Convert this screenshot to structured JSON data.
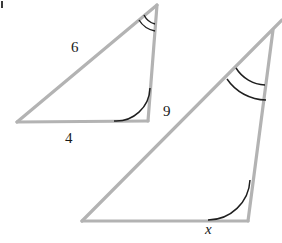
{
  "figure": {
    "stroke_color": "#b3b3b3",
    "arc_color": "#1f1f1f",
    "background": "#ffffff",
    "line_width": 3.2,
    "arc_width": 1.4
  },
  "small_triangle": {
    "name": "small-triangle",
    "vertices": {
      "left": {
        "x": 17,
        "y": 122
      },
      "apex": {
        "x": 157,
        "y": 5
      },
      "right": {
        "x": 148,
        "y": 121
      }
    },
    "labels": {
      "hypotenuse": "6",
      "base": "4"
    },
    "angle_marks": {
      "apex": "double-arc",
      "right": "single-arc",
      "left": "none"
    }
  },
  "large_triangle": {
    "name": "large-triangle",
    "vertices": {
      "left": {
        "x": 82,
        "y": 221
      },
      "apex": {
        "x": 281,
        "y": 21
      },
      "right": {
        "x": 248,
        "y": 221
      }
    },
    "labels": {
      "hypotenuse": "9",
      "base": "x"
    },
    "angle_marks": {
      "apex": "double-arc",
      "right": "single-arc",
      "left": "none"
    }
  },
  "artifact": {
    "name": "scan-artifact-top-left",
    "color": "#3a3a3a"
  }
}
